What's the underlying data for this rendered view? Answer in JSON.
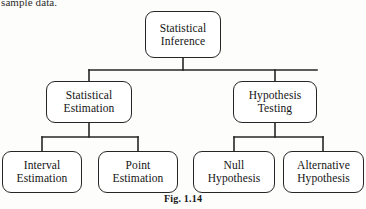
{
  "page": {
    "clipped_text": "sample data.",
    "caption": "Fig. 1.14",
    "background_color": "#fdfdfc",
    "line_color": "#262626",
    "text_color": "#141414"
  },
  "diagram": {
    "type": "hierarchy-tree",
    "orientation": "top-down",
    "levels": 3,
    "nodes": {
      "root": {
        "label": "Statistical Inference",
        "line1": "Statistical",
        "line2": "Inference"
      },
      "estimation": {
        "label": "Statistical Estimation",
        "line1": "Statistical",
        "line2": "Estimation"
      },
      "testing": {
        "label": "Hypothesis Testing",
        "line1": "Hypothesis",
        "line2": "Testing"
      },
      "interval": {
        "label": "Interval Estimation",
        "line1": "Interval",
        "line2": "Estimation"
      },
      "point": {
        "label": "Point Estimation",
        "line1": "Point",
        "line2": "Estimation"
      },
      "null_hypothesis": {
        "label": "Null Hypothesis",
        "line1": "Null",
        "line2": "Hypothesis"
      },
      "alternative_hypothesis": {
        "label": "Alternative Hypothesis",
        "line1": "Alternative",
        "line2": "Hypothesis"
      }
    },
    "edges": [
      {
        "from": "root",
        "to": "estimation"
      },
      {
        "from": "root",
        "to": "testing"
      },
      {
        "from": "estimation",
        "to": "interval"
      },
      {
        "from": "estimation",
        "to": "point"
      },
      {
        "from": "testing",
        "to": "null_hypothesis"
      },
      {
        "from": "testing",
        "to": "alternative_hypothesis"
      }
    ]
  }
}
